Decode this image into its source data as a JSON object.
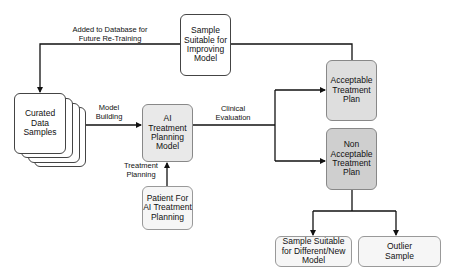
{
  "diagram": {
    "nodes": {
      "curated": "Curated Data Samples",
      "ai_model": "AI Treatment Planning Model",
      "patient": "Patient For AI Treatment Planning",
      "improving": "Sample Suitable for Improving Model",
      "acceptable": "Acceptable Treatment Plan",
      "non_acceptable": "Non Acceptable Treatment Plan",
      "different_model": "Sample Suitable for Different/New Model",
      "outlier": "Outlier Sample"
    },
    "edges": {
      "model_building": "Model Building",
      "clinical_evaluation": "Clinical Evaluation",
      "treatment_planning": "Treatment Planning",
      "added_to_db": "Added to Database for Future Re-Training"
    }
  }
}
